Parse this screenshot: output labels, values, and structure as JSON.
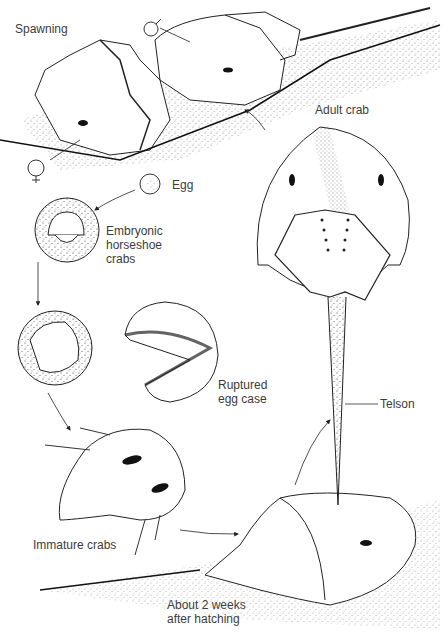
{
  "labels": {
    "spawning": "Spawning",
    "male_symbol": "♂",
    "female_symbol": "♀",
    "egg": "Egg",
    "embryonic": "Embryonic\nhorseshoe\ncrabs",
    "ruptured": "Ruptured\negg case",
    "immature": "Immature crabs",
    "two_weeks": "About 2 weeks\nafter hatching",
    "adult": "Adult crab",
    "telson": "Telson"
  },
  "stages": [
    "Spawning",
    "Egg",
    "Embryonic horseshoe crabs",
    "Ruptured egg case",
    "Immature crabs",
    "About 2 weeks after hatching",
    "Adult crab"
  ],
  "colors": {
    "ink": "#1a1a1a",
    "stipple": "#555555",
    "text": "#3c3c3c",
    "background": "#ffffff"
  }
}
